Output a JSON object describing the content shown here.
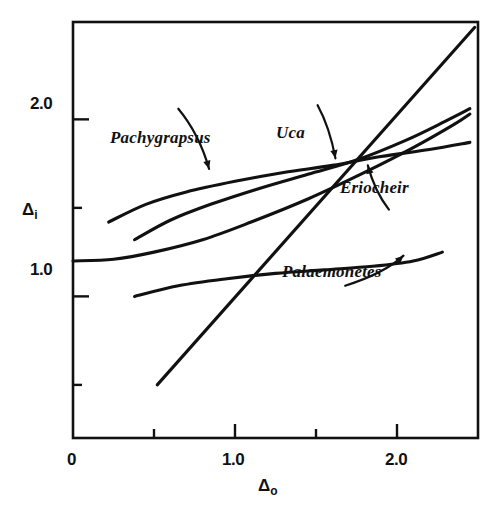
{
  "figure": {
    "background_color": "#ffffff",
    "line_color": "#111111"
  },
  "axes": {
    "x_title_main": "Δ",
    "x_title_sub": "o",
    "y_title_main": "Δ",
    "y_title_sub": "i",
    "x_ticks": [
      {
        "value": 0,
        "label": "0",
        "major": true
      },
      {
        "value": 0.5,
        "label": "",
        "major": false
      },
      {
        "value": 1.0,
        "label": "1.0",
        "major": true
      },
      {
        "value": 1.5,
        "label": "",
        "major": false
      },
      {
        "value": 2.0,
        "label": "2.0",
        "major": true
      }
    ],
    "y_ticks": [
      {
        "value": 0.5,
        "label": "",
        "major": false
      },
      {
        "value": 1.0,
        "label": "1.0",
        "major": true
      },
      {
        "value": 1.5,
        "label": "",
        "major": false
      },
      {
        "value": 2.0,
        "label": "2.0",
        "major": true
      }
    ]
  },
  "chart_data": {
    "type": "line",
    "title": "",
    "subtitle": "",
    "xlabel": "Δo",
    "ylabel": "Δi",
    "xlim": [
      0,
      2.5
    ],
    "ylim": [
      0.2,
      2.55
    ],
    "grid": false,
    "legend": "inline-annotations",
    "annotations": [
      {
        "text": "Pachygrapsus",
        "series": "Pachygrapsus",
        "x": 0.65,
        "y": 2.06,
        "arrow_to_x": 0.84,
        "arrow_to_y": 1.72
      },
      {
        "text": "Uca",
        "series": "Uca",
        "x": 1.51,
        "y": 2.08,
        "arrow_to_x": 1.62,
        "arrow_to_y": 1.78
      },
      {
        "text": "Eriocheir",
        "series": "Eriocheir",
        "x": 1.95,
        "y": 1.49,
        "arrow_to_x": 1.82,
        "arrow_to_y": 1.74
      },
      {
        "text": "Palaemonetes",
        "series": "Palaemonetes",
        "x": 1.68,
        "y": 1.06,
        "arrow_to_x": 2.04,
        "arrow_to_y": 1.23
      }
    ],
    "series": [
      {
        "name": "Uca",
        "note": "strong hyper-regulator, flattest upper curve",
        "x": [
          0.22,
          0.45,
          0.7,
          1.0,
          1.3,
          1.6,
          1.9,
          2.2,
          2.45
        ],
        "y": [
          1.42,
          1.52,
          1.59,
          1.65,
          1.7,
          1.74,
          1.79,
          1.83,
          1.87
        ]
      },
      {
        "name": "Pachygrapsus",
        "note": "hyper-regulator rising more steeply at high concentration",
        "x": [
          0.38,
          0.6,
          0.85,
          1.15,
          1.45,
          1.75,
          2.05,
          2.3,
          2.45
        ],
        "y": [
          1.32,
          1.43,
          1.52,
          1.61,
          1.69,
          1.77,
          1.88,
          1.99,
          2.06
        ]
      },
      {
        "name": "Eriocheir",
        "note": "flat at low concentration then rises, starts on the y-axis",
        "x": [
          0.0,
          0.25,
          0.5,
          0.8,
          1.1,
          1.45,
          1.8,
          2.1,
          2.35,
          2.45
        ],
        "y": [
          1.2,
          1.21,
          1.25,
          1.32,
          1.42,
          1.55,
          1.7,
          1.84,
          1.97,
          2.03
        ]
      },
      {
        "name": "Palaemonetes",
        "note": "weak regulator, nearly horizontal",
        "x": [
          0.38,
          0.65,
          0.95,
          1.25,
          1.55,
          1.85,
          2.1,
          2.28
        ],
        "y": [
          1.0,
          1.06,
          1.1,
          1.13,
          1.15,
          1.17,
          1.2,
          1.25
        ]
      },
      {
        "name": "isosmotic-line",
        "note": "straight diagonal reference line, internal equals external",
        "x": [
          0.52,
          2.48
        ],
        "y": [
          0.5,
          2.52
        ]
      }
    ]
  },
  "labels": {
    "pachygrapsus": "Pachygrapsus",
    "uca": "Uca",
    "eriocheir": "Eriocheir",
    "palaemonetes": "Palaemonetes"
  },
  "tick_text": {
    "x_zero": "0",
    "x_one": "1.0",
    "x_two": "2.0",
    "y_one": "1.0",
    "y_two": "2.0"
  }
}
